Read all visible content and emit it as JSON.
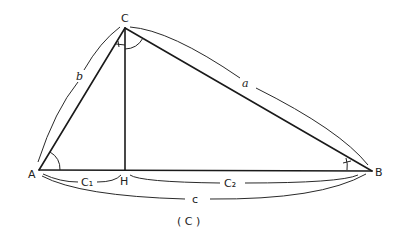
{
  "diagram": {
    "type": "right-triangle-altitude",
    "caption": "( C )",
    "vertices": {
      "A": {
        "label": "A",
        "x": 39,
        "y": 170
      },
      "B": {
        "label": "B",
        "x": 372,
        "y": 171
      },
      "C": {
        "label": "C",
        "x": 125,
        "y": 28
      },
      "H": {
        "label": "H",
        "x": 125,
        "y": 170
      }
    },
    "sides": {
      "a": {
        "label": "a",
        "from": "C",
        "to": "B"
      },
      "b": {
        "label": "b",
        "from": "A",
        "to": "C"
      },
      "c": {
        "label": "c",
        "from": "A",
        "to": "B"
      },
      "c1": {
        "label": "C₁",
        "from": "A",
        "to": "H"
      },
      "c2": {
        "label": "C₂",
        "from": "H",
        "to": "B"
      }
    },
    "altitude": {
      "from": "C",
      "to": "H"
    },
    "angle_marks": [
      "angle-A",
      "angle-ACB",
      "angle-ACH-tick",
      "angle-B-tick"
    ],
    "stroke_color": "#1a1a1a",
    "background": "#ffffff"
  }
}
